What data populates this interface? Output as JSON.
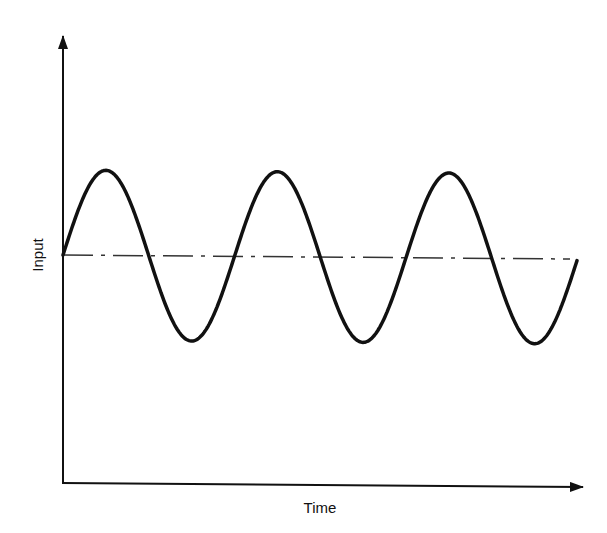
{
  "diagram": {
    "type": "waveform",
    "x_axis_label": "Time",
    "y_axis_label": "Input",
    "waveform": "sine",
    "cycles_shown": 3,
    "starts_at": "mean level, rising",
    "reference_line": "dash-dot mean level",
    "colors": {
      "ink": "#111111",
      "background": "#ffffff"
    }
  }
}
